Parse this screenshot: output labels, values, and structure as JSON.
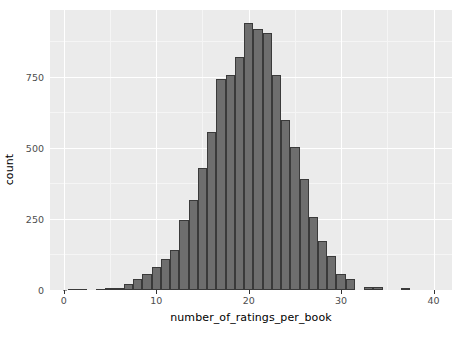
{
  "chart_data": {
    "type": "bar",
    "title": "",
    "subtitle": "",
    "xlabel": "number_of_ratings_per_book",
    "ylabel": "count",
    "xlim": [
      -1.5,
      42
    ],
    "ylim": [
      0,
      985
    ],
    "grid": true,
    "legend": null,
    "bin_width": 1,
    "xticks": [
      0,
      10,
      20,
      30,
      40
    ],
    "xtick_labels": [
      "0",
      "10",
      "20",
      "30",
      "40"
    ],
    "yticks": [
      0,
      250,
      500,
      750
    ],
    "ytick_labels": [
      "0",
      "250",
      "500",
      "750"
    ],
    "x_minor_ticks": [
      5,
      15,
      25,
      35
    ],
    "y_minor_ticks": [
      125,
      375,
      625,
      875
    ],
    "bar_fill_color": "#6e6e6e",
    "bar_border_color": "#3a3a3a",
    "panel_color": "#ebebeb",
    "grid_color": "#ffffff",
    "categories": [
      1,
      2,
      4,
      5,
      6,
      7,
      8,
      9,
      10,
      11,
      12,
      13,
      14,
      15,
      16,
      17,
      18,
      19,
      20,
      21,
      22,
      23,
      24,
      25,
      26,
      27,
      28,
      29,
      30,
      31,
      33,
      34,
      37
    ],
    "values": [
      3,
      3,
      4,
      6,
      7,
      22,
      38,
      55,
      80,
      108,
      140,
      245,
      318,
      428,
      557,
      742,
      757,
      818,
      940,
      918,
      903,
      755,
      598,
      503,
      390,
      258,
      172,
      118,
      57,
      40,
      12,
      12,
      6
    ]
  },
  "axes": {
    "y_title": "count",
    "x_title": "number_of_ratings_per_book"
  }
}
